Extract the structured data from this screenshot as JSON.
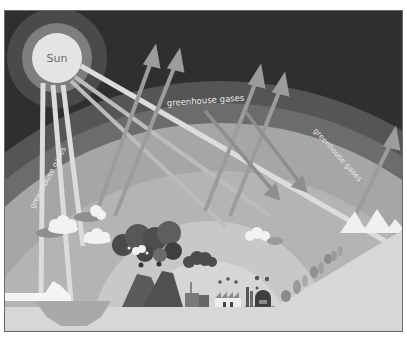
{
  "diagram": {
    "colors": {
      "sky": "#2e2e2e",
      "outer_ring": "#5a5a5a",
      "gas_band": "#6b6b6b",
      "inner_atmosphere": "#a9a9a9",
      "inner_glow": "#c9c9c9",
      "ground": "#d9d9d9",
      "sun": "#e6e6e6",
      "sun_ring_1": "#8f8f8f",
      "sun_ring_2": "#5c5c5c",
      "ray": "#dedede",
      "reflected_ray": "#9a9a9a"
    },
    "sun": {
      "label": "Sun"
    },
    "labels": {
      "gas_top": "greenhouse gases",
      "gas_left": "greenhouse gases",
      "gas_right": "greenhouse gases"
    },
    "elements": [
      {
        "name": "sun",
        "label": "Sun"
      },
      {
        "name": "incoming-solar-rays"
      },
      {
        "name": "reflected-rays-escaping"
      },
      {
        "name": "trapped-heat-rays"
      },
      {
        "name": "clouds"
      },
      {
        "name": "volcanoes-with-smoke"
      },
      {
        "name": "factories"
      },
      {
        "name": "trees"
      },
      {
        "name": "mountains"
      },
      {
        "name": "ice-floe"
      }
    ]
  }
}
